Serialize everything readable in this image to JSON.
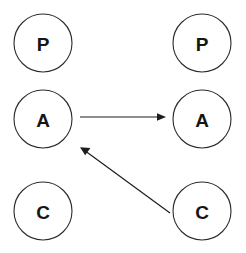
{
  "diagram": {
    "background_color": "#ffffff",
    "stroke_color": "#2b2b2b",
    "label_color": "#151515",
    "edge_color": "#1d1d1d",
    "canvas": {
      "width": 246,
      "height": 253
    },
    "columns": [
      {
        "name": "left-column",
        "center_x": 43
      },
      {
        "name": "right-column",
        "center_x": 202
      }
    ],
    "rows": [
      {
        "name": "top-row",
        "center_y": 43
      },
      {
        "name": "middle-row",
        "center_y": 119
      },
      {
        "name": "bottom-row",
        "center_y": 211
      }
    ],
    "node_radius": 29,
    "nodes": [
      {
        "id": "left-p",
        "label": "P",
        "cx": 43,
        "cy": 43,
        "r": 29,
        "column": "left",
        "row": "top"
      },
      {
        "id": "right-p",
        "label": "P",
        "cx": 202,
        "cy": 43,
        "r": 29,
        "column": "right",
        "row": "top"
      },
      {
        "id": "left-a",
        "label": "A",
        "cx": 43,
        "cy": 119,
        "r": 29,
        "column": "left",
        "row": "middle"
      },
      {
        "id": "right-a",
        "label": "A",
        "cx": 202,
        "cy": 119,
        "r": 29,
        "column": "right",
        "row": "middle"
      },
      {
        "id": "left-c",
        "label": "C",
        "cx": 43,
        "cy": 211,
        "r": 29,
        "column": "left",
        "row": "bottom"
      },
      {
        "id": "right-c",
        "label": "C",
        "cx": 202,
        "cy": 211,
        "r": 29,
        "column": "right",
        "row": "bottom"
      }
    ],
    "edges": [
      {
        "id": "edge-left-a-to-right-a",
        "from": "left-a",
        "to": "right-a",
        "direction": "left-to-right",
        "shape": "straight-horizontal",
        "x1": 80,
        "y1": 117,
        "x2": 165,
        "y2": 117,
        "arrow_at": "end",
        "arrow_tip_x": 166,
        "arrow_tip_y": 117
      },
      {
        "id": "edge-right-c-to-left-a",
        "from": "right-c",
        "to": "left-a",
        "direction": "right-to-left-upward",
        "shape": "straight-diagonal",
        "x1": 170,
        "y1": 213,
        "x2": 81,
        "y2": 148,
        "arrow_at": "end",
        "arrow_tip_x": 80,
        "arrow_tip_y": 147
      }
    ]
  }
}
